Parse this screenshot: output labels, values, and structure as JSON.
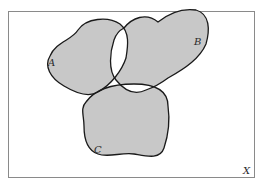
{
  "diagram": {
    "type": "venn",
    "universe_label": "X",
    "sets": [
      {
        "label": "A"
      },
      {
        "label": "B"
      },
      {
        "label": "C"
      }
    ],
    "shaded_description": "Regions belonging to exactly one set, plus the triple intersection A∩B∩C",
    "colors": {
      "shade": "#c8c8c8",
      "outline": "#1a1a1a",
      "frame": "#8a8a8a",
      "background": "#ffffff"
    }
  }
}
